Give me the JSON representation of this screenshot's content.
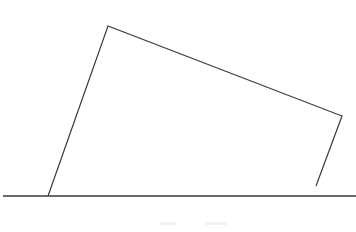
{
  "diagram": {
    "stroke_color": "#3a3a3a",
    "ground_line": {
      "x1": 3,
      "y1": 196,
      "x2": 356,
      "y2": 196
    },
    "shape": {
      "vertices": [
        [
          48,
          196
        ],
        [
          108,
          26
        ],
        [
          342,
          116
        ],
        [
          316,
          186
        ]
      ],
      "open_bottom_right": true
    },
    "caption_marks": [
      {
        "x": 160,
        "width": 16
      },
      {
        "x": 205,
        "width": 22
      }
    ]
  }
}
